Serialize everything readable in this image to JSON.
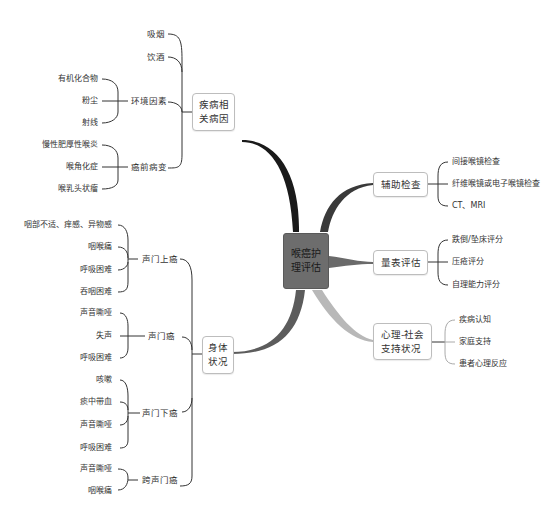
{
  "central": {
    "label_line1": "喉癌护",
    "label_line2": "理评估",
    "color": "#6d6d6d"
  },
  "branches": {
    "disease_causes": {
      "label_line1": "疾病相",
      "label_line2": "关病因",
      "line_color": "#1a1a1a",
      "items": [
        {
          "label": "吸烟"
        },
        {
          "label": "饮酒"
        },
        {
          "label": "环境因素",
          "children": [
            "有机化合物",
            "粉尘",
            "射线"
          ]
        },
        {
          "label": "癌前病变",
          "children": [
            "慢性肥厚性喉炎",
            "喉角化症",
            "喉乳头状瘤"
          ]
        }
      ]
    },
    "physical_status": {
      "label_line1": "身体",
      "label_line2": "状况",
      "line_color": "#555555",
      "items": [
        {
          "label": "声门上癌",
          "children": [
            "咽部不适、痒感、异物感",
            "咽喉痛",
            "呼吸困难",
            "吞咽困难"
          ]
        },
        {
          "label": "声门癌",
          "children": [
            "声音嘶哑",
            "失声",
            "呼吸困难"
          ]
        },
        {
          "label": "声门下癌",
          "children": [
            "咳嗽",
            "痰中带血",
            "声音嘶哑",
            "呼吸困难"
          ]
        },
        {
          "label": "跨声门癌",
          "children": [
            "声音嘶哑",
            "咽喉痛"
          ]
        }
      ]
    },
    "auxiliary_exam": {
      "label": "辅助检查",
      "line_color": "#333333",
      "items": [
        "间接喉镜检查",
        "纤维喉镜或电子喉镜检查",
        "CT、MRI"
      ]
    },
    "scale_assessment": {
      "label": "量表评估",
      "line_color": "#777777",
      "items": [
        "跌倒/坠床评分",
        "压疮评分",
        "自理能力评分"
      ]
    },
    "psychosocial": {
      "label_line1": "心理-社会",
      "label_line2": "支持状况",
      "line_color": "#b5b5b5",
      "items": [
        "疾病认知",
        "家庭支持",
        "患者心理反应"
      ]
    }
  }
}
